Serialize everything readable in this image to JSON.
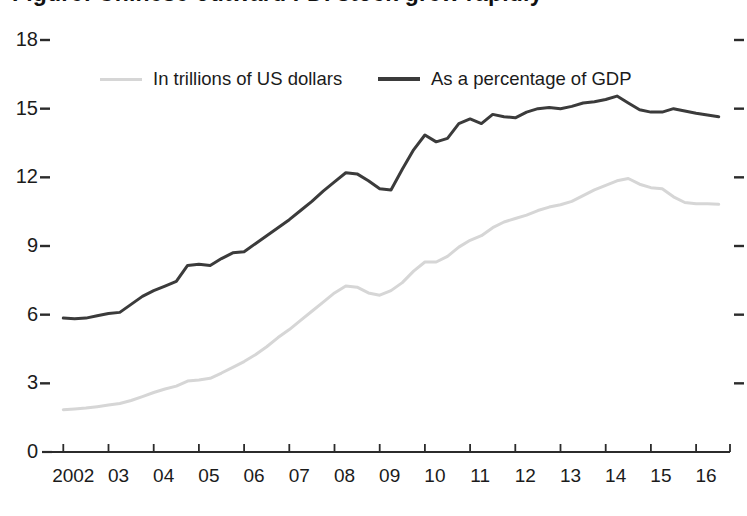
{
  "figure": {
    "title_remnant": "Figure: Chinese outward FDI stock grew rapidly",
    "background": "#ffffff"
  },
  "chart_data": {
    "type": "line",
    "title": "",
    "xlabel": "",
    "ylabel": "",
    "xlim": [
      2001.75,
      2016.75
    ],
    "ylim": [
      0,
      18
    ],
    "yticks": [
      0,
      3,
      6,
      9,
      12,
      15,
      18
    ],
    "ytick_labels": [
      "0",
      "3",
      "6",
      "9",
      "12",
      "15",
      "18"
    ],
    "grid": false,
    "legend_position": "top-left-inside",
    "axis_color": "#2b2b2b",
    "x": [
      2002,
      2002.25,
      2002.5,
      2002.75,
      2003,
      2003.25,
      2003.5,
      2003.75,
      2004,
      2004.25,
      2004.5,
      2004.75,
      2005,
      2005.25,
      2005.5,
      2005.75,
      2006,
      2006.25,
      2006.5,
      2006.75,
      2007,
      2007.25,
      2007.5,
      2007.75,
      2008,
      2008.25,
      2008.5,
      2008.75,
      2009,
      2009.25,
      2009.5,
      2009.75,
      2010,
      2010.25,
      2010.5,
      2010.75,
      2011,
      2011.25,
      2011.5,
      2011.75,
      2012,
      2012.25,
      2012.5,
      2012.75,
      2013,
      2013.25,
      2013.5,
      2013.75,
      2014,
      2014.25,
      2014.5,
      2014.75,
      2015,
      2015.25,
      2015.5,
      2015.75,
      2016,
      2016.25,
      2016.5
    ],
    "xticks": [
      2002,
      2003,
      2004,
      2005,
      2006,
      2007,
      2008,
      2009,
      2010,
      2011,
      2012,
      2013,
      2014,
      2015,
      2016
    ],
    "xtick_labels": [
      "2002",
      "03",
      "04",
      "05",
      "06",
      "07",
      "08",
      "09",
      "10",
      "11",
      "12",
      "13",
      "14",
      "15",
      "16"
    ],
    "series": [
      {
        "name": "As a percentage of GDP",
        "color": "#3b3b3b",
        "width": 3.0,
        "unit": "percent of GDP",
        "values": [
          5.85,
          5.82,
          5.85,
          5.95,
          6.05,
          6.1,
          6.45,
          6.8,
          7.05,
          7.25,
          7.45,
          8.15,
          8.2,
          8.15,
          8.45,
          8.7,
          8.75,
          9.1,
          9.45,
          9.8,
          10.15,
          10.55,
          10.95,
          11.4,
          11.8,
          12.2,
          12.15,
          11.85,
          11.5,
          11.45,
          12.35,
          13.2,
          13.85,
          13.55,
          13.7,
          14.35,
          14.55,
          14.35,
          14.75,
          14.65,
          14.6,
          14.85,
          15.0,
          15.05,
          15.0,
          15.1,
          15.25,
          15.3,
          15.4,
          15.55,
          15.25,
          14.95,
          14.85,
          14.85,
          15.0,
          14.9,
          14.8,
          14.72,
          14.65
        ]
      },
      {
        "name": "In trillions of US dollars",
        "color": "#d6d6d6",
        "width": 3.0,
        "unit": "trillions of US dollars",
        "values": [
          1.85,
          1.88,
          1.92,
          1.98,
          2.05,
          2.12,
          2.25,
          2.42,
          2.6,
          2.75,
          2.88,
          3.1,
          3.15,
          3.22,
          3.45,
          3.7,
          3.95,
          4.25,
          4.6,
          5.0,
          5.35,
          5.75,
          6.15,
          6.55,
          6.95,
          7.25,
          7.2,
          6.95,
          6.85,
          7.05,
          7.4,
          7.9,
          8.3,
          8.3,
          8.55,
          8.95,
          9.25,
          9.45,
          9.8,
          10.05,
          10.2,
          10.35,
          10.55,
          10.7,
          10.8,
          10.95,
          11.2,
          11.45,
          11.65,
          11.85,
          11.95,
          11.7,
          11.55,
          11.5,
          11.15,
          10.9,
          10.85,
          10.85,
          10.82
        ]
      }
    ],
    "legend": [
      {
        "label": "In trillions of US dollars",
        "color": "#d6d6d6"
      },
      {
        "label": "As a percentage of GDP",
        "color": "#3b3b3b"
      }
    ]
  }
}
